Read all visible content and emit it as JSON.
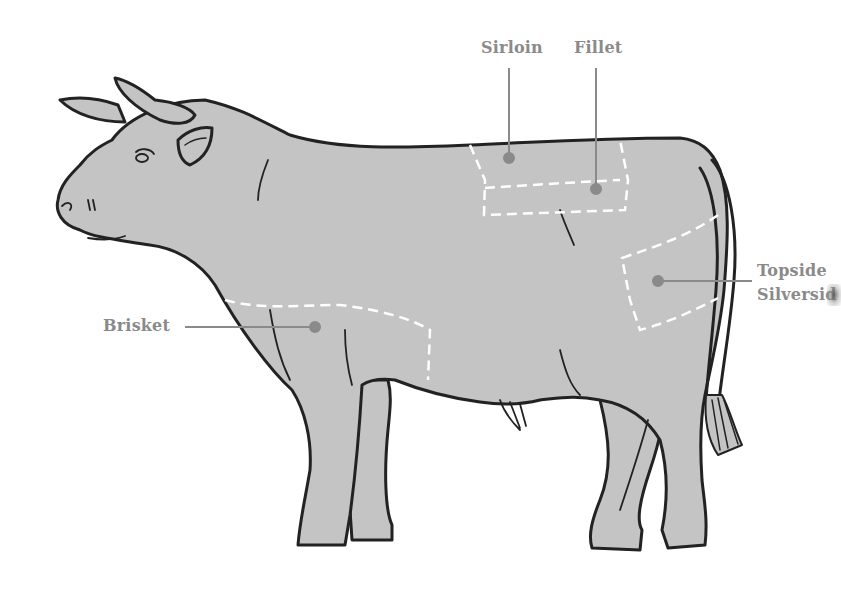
{
  "diagram": {
    "colors": {
      "body_fill": "#c4c4c4",
      "outline": "#222222",
      "cut_lines": "#ffffff",
      "leader_lines": "#8a8a8a",
      "label_text": "#8a8a8a",
      "background": "#ffffff"
    },
    "labels": [
      {
        "id": "sirloin",
        "text": "Sirloin"
      },
      {
        "id": "fillet",
        "text": "Fillet"
      },
      {
        "id": "topside",
        "text": "Topside"
      },
      {
        "id": "silverside",
        "text": "Silversid"
      },
      {
        "id": "brisket",
        "text": "Brisket"
      }
    ]
  }
}
